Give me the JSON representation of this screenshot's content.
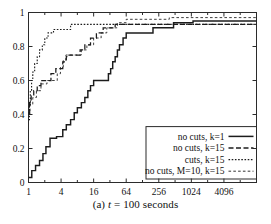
{
  "figure": {
    "caption_prefix": "(a)",
    "caption_var": "t",
    "caption_rest": "= 100 seconds",
    "caption_full": "(a) t = 100 seconds"
  },
  "chart_data": {
    "type": "line",
    "title": "",
    "subtitle": "",
    "xlabel": "",
    "ylabel": "",
    "xscale": "log2",
    "yscale": "linear",
    "xlim": [
      1,
      16384
    ],
    "ylim": [
      0,
      1
    ],
    "grid": false,
    "xticks": [
      1,
      4,
      16,
      64,
      256,
      1024,
      4096
    ],
    "xtick_labels": [
      "1",
      "4",
      "16",
      "64",
      "256",
      "1024",
      "4096"
    ],
    "yticks": [
      0,
      0.2,
      0.4,
      0.6,
      0.8,
      1
    ],
    "ytick_labels": [
      "0",
      "0.2",
      "0.4",
      "0.6",
      "0.8",
      "1"
    ],
    "legend_position": "bottom-right",
    "legend_entries": [
      {
        "label": "no cuts, k=1",
        "dash": "none",
        "width": 1.5
      },
      {
        "label": "no cuts, k=15",
        "dash": "5,2.5",
        "width": 1.3
      },
      {
        "label": "cuts, k=15",
        "dash": "1.6,1.6",
        "width": 1.2
      },
      {
        "label": "no cuts, M=10, k=15",
        "dash": "2.6,2.2",
        "width": 0.9
      }
    ],
    "series": [
      {
        "name": "no cuts, k=1",
        "dash": "none",
        "points": [
          [
            1,
            0.03
          ],
          [
            1.15,
            0.03
          ],
          [
            1.15,
            0.07
          ],
          [
            1.35,
            0.07
          ],
          [
            1.35,
            0.1
          ],
          [
            1.6,
            0.1
          ],
          [
            1.6,
            0.13
          ],
          [
            1.85,
            0.13
          ],
          [
            1.85,
            0.17
          ],
          [
            2.1,
            0.17
          ],
          [
            2.1,
            0.21
          ],
          [
            2.5,
            0.21
          ],
          [
            2.5,
            0.26
          ],
          [
            3.3,
            0.26
          ],
          [
            3.3,
            0.27
          ],
          [
            4.3,
            0.27
          ],
          [
            4.3,
            0.31
          ],
          [
            5.0,
            0.31
          ],
          [
            5.0,
            0.34
          ],
          [
            6.0,
            0.34
          ],
          [
            6.0,
            0.37
          ],
          [
            7.0,
            0.37
          ],
          [
            7.0,
            0.41
          ],
          [
            8.0,
            0.41
          ],
          [
            8.0,
            0.44
          ],
          [
            9.5,
            0.44
          ],
          [
            9.5,
            0.47
          ],
          [
            11.0,
            0.47
          ],
          [
            11.0,
            0.5
          ],
          [
            12.5,
            0.5
          ],
          [
            12.5,
            0.54
          ],
          [
            14.0,
            0.54
          ],
          [
            14.0,
            0.57
          ],
          [
            16.0,
            0.57
          ],
          [
            16.0,
            0.6
          ],
          [
            30.0,
            0.6
          ],
          [
            30.0,
            0.64
          ],
          [
            33.0,
            0.64
          ],
          [
            33.0,
            0.67
          ],
          [
            36.0,
            0.67
          ],
          [
            36.0,
            0.71
          ],
          [
            40.0,
            0.71
          ],
          [
            40.0,
            0.74
          ],
          [
            44.0,
            0.74
          ],
          [
            44.0,
            0.78
          ],
          [
            48.0,
            0.78
          ],
          [
            48.0,
            0.81
          ],
          [
            56.0,
            0.81
          ],
          [
            56.0,
            0.85
          ],
          [
            64.0,
            0.85
          ],
          [
            64.0,
            0.88
          ],
          [
            200.0,
            0.88
          ],
          [
            200.0,
            0.91
          ],
          [
            480.0,
            0.91
          ],
          [
            480.0,
            0.94
          ],
          [
            1100.0,
            0.94
          ],
          [
            1100.0,
            0.95
          ],
          [
            16384,
            0.95
          ]
        ]
      },
      {
        "name": "no cuts, k=15",
        "dash": "5,2.5",
        "points": [
          [
            1,
            0.41
          ],
          [
            1.05,
            0.41
          ],
          [
            1.05,
            0.47
          ],
          [
            1.12,
            0.47
          ],
          [
            1.12,
            0.51
          ],
          [
            1.25,
            0.51
          ],
          [
            1.25,
            0.54
          ],
          [
            1.45,
            0.54
          ],
          [
            1.45,
            0.57
          ],
          [
            1.7,
            0.57
          ],
          [
            1.7,
            0.6
          ],
          [
            2.6,
            0.6
          ],
          [
            2.6,
            0.64
          ],
          [
            3.2,
            0.64
          ],
          [
            3.2,
            0.67
          ],
          [
            4.3,
            0.67
          ],
          [
            4.3,
            0.71
          ],
          [
            5.0,
            0.71
          ],
          [
            5.0,
            0.74
          ],
          [
            5.6,
            0.74
          ],
          [
            5.6,
            0.75
          ],
          [
            9.0,
            0.75
          ],
          [
            9.0,
            0.78
          ],
          [
            11.0,
            0.78
          ],
          [
            11.0,
            0.81
          ],
          [
            14.0,
            0.81
          ],
          [
            14.0,
            0.85
          ],
          [
            18.0,
            0.85
          ],
          [
            18.0,
            0.88
          ],
          [
            24.0,
            0.88
          ],
          [
            24.0,
            0.91
          ],
          [
            40.0,
            0.91
          ],
          [
            40.0,
            0.93
          ],
          [
            16384,
            0.93
          ]
        ]
      },
      {
        "name": "cuts, k=15",
        "dash": "1.6,1.6",
        "points": [
          [
            1,
            0.37
          ],
          [
            1.04,
            0.37
          ],
          [
            1.04,
            0.45
          ],
          [
            1.08,
            0.45
          ],
          [
            1.08,
            0.54
          ],
          [
            1.14,
            0.54
          ],
          [
            1.14,
            0.6
          ],
          [
            1.2,
            0.6
          ],
          [
            1.2,
            0.65
          ],
          [
            1.3,
            0.65
          ],
          [
            1.3,
            0.7
          ],
          [
            1.45,
            0.7
          ],
          [
            1.45,
            0.74
          ],
          [
            1.6,
            0.74
          ],
          [
            1.6,
            0.78
          ],
          [
            1.8,
            0.78
          ],
          [
            1.8,
            0.81
          ],
          [
            2.0,
            0.81
          ],
          [
            2.0,
            0.85
          ],
          [
            2.3,
            0.85
          ],
          [
            2.3,
            0.88
          ],
          [
            2.9,
            0.88
          ],
          [
            2.9,
            0.9
          ],
          [
            6.0,
            0.9
          ],
          [
            6.0,
            0.93
          ],
          [
            16384,
            0.93
          ]
        ]
      },
      {
        "name": "no cuts, M=10, k=15",
        "dash": "2.6,2.2",
        "points": [
          [
            1,
            0.4
          ],
          [
            1.06,
            0.4
          ],
          [
            1.06,
            0.46
          ],
          [
            1.2,
            0.46
          ],
          [
            1.2,
            0.5
          ],
          [
            1.4,
            0.5
          ],
          [
            1.4,
            0.54
          ],
          [
            1.7,
            0.54
          ],
          [
            1.7,
            0.58
          ],
          [
            2.2,
            0.58
          ],
          [
            2.2,
            0.6
          ],
          [
            3.4,
            0.6
          ],
          [
            3.4,
            0.64
          ],
          [
            3.9,
            0.64
          ],
          [
            3.9,
            0.68
          ],
          [
            4.4,
            0.68
          ],
          [
            4.4,
            0.72
          ],
          [
            4.9,
            0.72
          ],
          [
            4.9,
            0.75
          ],
          [
            9.5,
            0.75
          ],
          [
            9.5,
            0.78
          ],
          [
            12.0,
            0.78
          ],
          [
            12.0,
            0.81
          ],
          [
            16.0,
            0.81
          ],
          [
            16.0,
            0.85
          ],
          [
            22.0,
            0.85
          ],
          [
            22.0,
            0.88
          ],
          [
            28.0,
            0.88
          ],
          [
            28.0,
            0.91
          ],
          [
            44.0,
            0.91
          ],
          [
            44.0,
            0.94
          ],
          [
            64.0,
            0.94
          ],
          [
            64.0,
            0.96
          ],
          [
            400.0,
            0.96
          ],
          [
            400.0,
            0.97
          ],
          [
            16384,
            0.97
          ]
        ]
      }
    ]
  }
}
